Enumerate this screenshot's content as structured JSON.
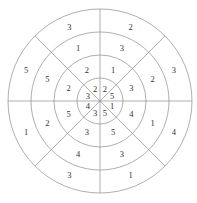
{
  "figure": {
    "kind": "concentric-ring-number-puzzle",
    "center": {
      "x": 100,
      "y": 101
    },
    "stroke_color": "#8d8d8d",
    "text_color": "#33332f",
    "background_color": "#ffffff",
    "ring_count": 4,
    "sectors_per_ring": 8,
    "ring_radii": [
      92,
      69,
      46,
      23
    ],
    "sector_boundary_angles_deg": [
      0,
      45,
      90,
      135,
      180,
      225,
      270,
      315
    ],
    "radial_divider_count": 4
  },
  "chart_data": {
    "type": "pie",
    "title": "",
    "subtitle": "",
    "xlabel": "",
    "ylabel": "",
    "legend_position": "none",
    "grid": false,
    "rings": [
      {
        "name": "ring-1-outer",
        "outer_radius": 92,
        "inner_radius": 69,
        "label_radius": 80,
        "cells": [
          {
            "sector": "N-NW",
            "angle_deg": 112.5,
            "value": "3"
          },
          {
            "sector": "N-NE",
            "angle_deg": 67.5,
            "value": "2"
          },
          {
            "sector": "E-NE",
            "angle_deg": 22.5,
            "value": "3"
          },
          {
            "sector": "E-SE",
            "angle_deg": 337.5,
            "value": "4"
          },
          {
            "sector": "S-SE",
            "angle_deg": 292.5,
            "value": "1"
          },
          {
            "sector": "S-SW",
            "angle_deg": 247.5,
            "value": "3"
          },
          {
            "sector": "W-SW",
            "angle_deg": 202.5,
            "value": "1"
          },
          {
            "sector": "W-NW",
            "angle_deg": 157.5,
            "value": "5"
          }
        ]
      },
      {
        "name": "ring-2",
        "outer_radius": 69,
        "inner_radius": 46,
        "label_radius": 57,
        "cells": [
          {
            "sector": "N-NW",
            "angle_deg": 112.5,
            "value": "1"
          },
          {
            "sector": "N-NE",
            "angle_deg": 67.5,
            "value": "3"
          },
          {
            "sector": "E-NE",
            "angle_deg": 22.5,
            "value": "2"
          },
          {
            "sector": "E-SE",
            "angle_deg": 337.5,
            "value": "1"
          },
          {
            "sector": "S-SE",
            "angle_deg": 292.5,
            "value": "3"
          },
          {
            "sector": "S-SW",
            "angle_deg": 247.5,
            "value": "4"
          },
          {
            "sector": "W-SW",
            "angle_deg": 202.5,
            "value": "2"
          },
          {
            "sector": "W-NW",
            "angle_deg": 157.5,
            "value": "5"
          }
        ]
      },
      {
        "name": "ring-3",
        "outer_radius": 46,
        "inner_radius": 23,
        "label_radius": 34,
        "cells": [
          {
            "sector": "N-NW",
            "angle_deg": 112.5,
            "value": "2"
          },
          {
            "sector": "N-NE",
            "angle_deg": 67.5,
            "value": "1"
          },
          {
            "sector": "E-NE",
            "angle_deg": 22.5,
            "value": "3"
          },
          {
            "sector": "E-SE",
            "angle_deg": 337.5,
            "value": "4"
          },
          {
            "sector": "S-SE",
            "angle_deg": 292.5,
            "value": "5"
          },
          {
            "sector": "S-SW",
            "angle_deg": 247.5,
            "value": "3"
          },
          {
            "sector": "W-SW",
            "angle_deg": 202.5,
            "value": "5"
          },
          {
            "sector": "W-NW",
            "angle_deg": 157.5,
            "value": "2"
          }
        ]
      },
      {
        "name": "ring-4-inner",
        "outer_radius": 23,
        "inner_radius": 0,
        "label_radius": 13,
        "cells": [
          {
            "sector": "N-NW",
            "angle_deg": 112.5,
            "value": "2"
          },
          {
            "sector": "N-NE",
            "angle_deg": 67.5,
            "value": "2"
          },
          {
            "sector": "E-NE",
            "angle_deg": 22.5,
            "value": "5"
          },
          {
            "sector": "E-SE",
            "angle_deg": 337.5,
            "value": "1"
          },
          {
            "sector": "S-SE",
            "angle_deg": 292.5,
            "value": "5"
          },
          {
            "sector": "S-SW",
            "angle_deg": 247.5,
            "value": "3"
          },
          {
            "sector": "W-SW",
            "angle_deg": 202.5,
            "value": "4"
          },
          {
            "sector": "W-NW",
            "angle_deg": 157.5,
            "value": "3"
          }
        ]
      }
    ]
  }
}
